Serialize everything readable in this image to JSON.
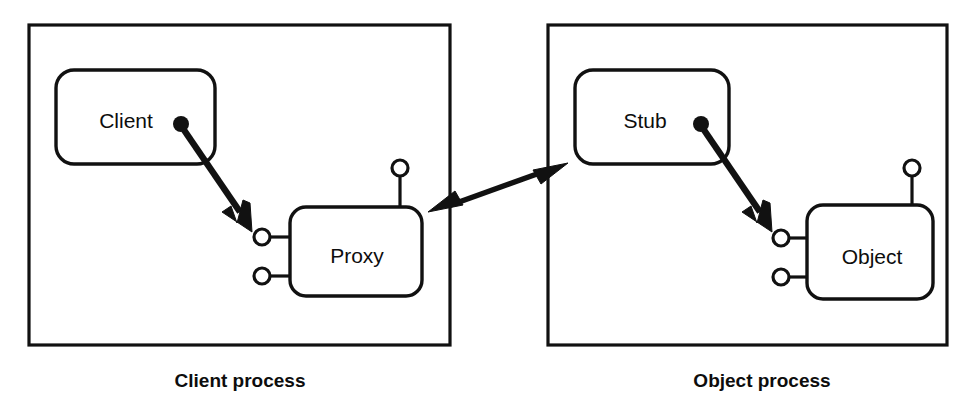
{
  "diagram": {
    "background_color": "#ffffff",
    "line_color": "#111111",
    "fill_color": "#ffffff",
    "processes": [
      {
        "id": "client-process",
        "caption": "Client process",
        "frame": {
          "x": 29,
          "y": 25,
          "w": 421,
          "h": 320
        },
        "caption_pos": {
          "x": 240,
          "y": 382
        }
      },
      {
        "id": "object-process",
        "caption": "Object process",
        "frame": {
          "x": 548,
          "y": 25,
          "w": 399,
          "h": 320
        },
        "caption_pos": {
          "x": 762,
          "y": 382
        }
      }
    ],
    "components": [
      {
        "id": "client-box",
        "label": "Client",
        "rect": {
          "x": 56,
          "y": 70,
          "w": 159,
          "h": 94,
          "r": 18
        },
        "label_pos": {
          "x": 126,
          "y": 122
        }
      },
      {
        "id": "proxy-box",
        "label": "Proxy",
        "rect": {
          "x": 290,
          "y": 207,
          "w": 132,
          "h": 89,
          "r": 16
        },
        "label_pos": {
          "x": 357,
          "y": 257
        }
      },
      {
        "id": "stub-box",
        "label": "Stub",
        "rect": {
          "x": 575,
          "y": 70,
          "w": 154,
          "h": 94,
          "r": 18
        },
        "label_pos": {
          "x": 645,
          "y": 122
        }
      },
      {
        "id": "object-box",
        "label": "Object",
        "rect": {
          "x": 807,
          "y": 205,
          "w": 126,
          "h": 94,
          "r": 16
        },
        "label_pos": {
          "x": 872,
          "y": 258
        }
      }
    ],
    "interfaces": [
      {
        "id": "proxy-top-interface",
        "cx": 400,
        "cy": 168,
        "r": 8,
        "stem": {
          "x1": 400,
          "y1": 176,
          "x2": 400,
          "y2": 208
        }
      },
      {
        "id": "proxy-left-upper-interface",
        "cx": 262,
        "cy": 237,
        "r": 8,
        "stem": {
          "x1": 270,
          "y1": 237,
          "x2": 291,
          "y2": 237
        }
      },
      {
        "id": "proxy-left-lower-interface",
        "cx": 262,
        "cy": 276,
        "r": 8,
        "stem": {
          "x1": 270,
          "y1": 276,
          "x2": 291,
          "y2": 276
        }
      },
      {
        "id": "object-top-interface",
        "cx": 912,
        "cy": 168,
        "r": 8,
        "stem": {
          "x1": 912,
          "y1": 176,
          "x2": 912,
          "y2": 206
        }
      },
      {
        "id": "object-left-upper-interface",
        "cx": 781,
        "cy": 238,
        "r": 8,
        "stem": {
          "x1": 789,
          "y1": 238,
          "x2": 808,
          "y2": 238
        }
      },
      {
        "id": "object-left-lower-interface",
        "cx": 781,
        "cy": 277,
        "r": 8,
        "stem": {
          "x1": 789,
          "y1": 277,
          "x2": 808,
          "y2": 277
        }
      }
    ],
    "invocation_arrows": [
      {
        "id": "client-to-proxy-arrow",
        "from": "client-box",
        "to": "proxy-left-upper-interface",
        "ball": {
          "cx": 181,
          "cy": 124,
          "r": 8
        },
        "line": {
          "x1": 184,
          "y1": 130,
          "x2": 240,
          "y2": 212
        },
        "head": "252,232 222,212 231,206 237,223 243,200 250,203"
      },
      {
        "id": "stub-to-object-arrow",
        "from": "stub-box",
        "to": "object-left-upper-interface",
        "ball": {
          "cx": 701,
          "cy": 124,
          "r": 8
        },
        "line": {
          "x1": 704,
          "y1": 130,
          "x2": 760,
          "y2": 212
        },
        "head": "772,232 742,212 751,206 757,223 763,200 770,203"
      }
    ],
    "link_arrow": {
      "id": "proxy-stub-link-arrow",
      "from": "proxy-box",
      "to": "stub-box",
      "line": {
        "x1": 448,
        "y1": 206,
        "x2": 548,
        "y2": 170
      },
      "head_right": "568,163 533,170 541,184",
      "head_left": "428,212 463,205 455,191"
    }
  }
}
